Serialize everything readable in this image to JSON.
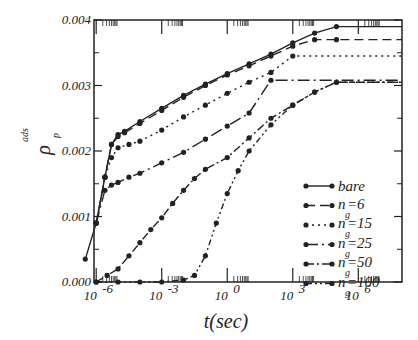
{
  "chart_data": {
    "type": "line",
    "title": "",
    "xlabel": "t(sec)",
    "ylabel": "ρ_p^ads",
    "ylabel_main": "ρ",
    "ylabel_sub": "p",
    "ylabel_sup": "ads",
    "xscale": "log",
    "xlim_log10": [
      -6,
      8
    ],
    "ylim": [
      0.0,
      0.004
    ],
    "x_tick_labels": [
      {
        "base": "10",
        "exp": "-6",
        "log": -6
      },
      {
        "base": "10",
        "exp": "-3",
        "log": -3
      },
      {
        "base": "10",
        "exp": "0",
        "log": 0
      },
      {
        "base": "10",
        "exp": "3",
        "log": 3
      },
      {
        "base": "10",
        "exp": "6",
        "log": 6
      }
    ],
    "y_tick_labels": [
      "0.000",
      "0.001",
      "0.002",
      "0.003",
      "0.004"
    ],
    "y_ticks": [
      0.0,
      0.001,
      0.002,
      0.003,
      0.004
    ],
    "grid": false,
    "legend_position": "lower right inside",
    "series": [
      {
        "name": "bare",
        "label": "bare",
        "sub": "",
        "dash": "",
        "log_t": [
          -6.5,
          -6.0,
          -5.6,
          -5.3,
          -5.0,
          -4.7,
          -4.0,
          -3.0,
          -2.0,
          -1.0,
          0.0,
          1.0,
          2.0,
          3.0,
          4.0,
          5.0,
          8.0
        ],
        "values": [
          0.00035,
          0.0009,
          0.0016,
          0.0021,
          0.00225,
          0.0023,
          0.00245,
          0.00265,
          0.00285,
          0.00302,
          0.00318,
          0.00333,
          0.00348,
          0.00365,
          0.0038,
          0.0039,
          0.0039
        ]
      },
      {
        "name": "n_g=6",
        "label": "n",
        "sub": "g",
        "value_text": "=6",
        "dash": "9,5",
        "log_t": [
          -6.0,
          -5.6,
          -5.3,
          -5.0,
          -4.7,
          -4.0,
          -3.0,
          -2.0,
          -1.0,
          0.0,
          1.0,
          2.0,
          3.0,
          4.0,
          5.0,
          8.0
        ],
        "values": [
          0.0009,
          0.0016,
          0.0021,
          0.00222,
          0.00228,
          0.00242,
          0.00262,
          0.00282,
          0.003,
          0.00316,
          0.0033,
          0.00345,
          0.0036,
          0.0037,
          0.0037,
          0.0037
        ]
      },
      {
        "name": "n_g=15",
        "label": "n",
        "sub": "g",
        "value_text": "=15",
        "dash": "2,4",
        "log_t": [
          -6.0,
          -5.6,
          -5.3,
          -5.0,
          -4.5,
          -4.0,
          -3.0,
          -2.0,
          -1.0,
          0.0,
          1.0,
          2.0,
          3.0,
          8.0
        ],
        "values": [
          0.0009,
          0.0016,
          0.0019,
          0.00205,
          0.0021,
          0.00215,
          0.00232,
          0.00252,
          0.0027,
          0.00288,
          0.00305,
          0.0032,
          0.00345,
          0.00345
        ]
      },
      {
        "name": "n_g=25",
        "label": "n",
        "sub": "g",
        "value_text": "=25",
        "dash": "12,4,2,4",
        "log_t": [
          -6.0,
          -5.6,
          -5.3,
          -5.0,
          -4.5,
          -4.0,
          -3.0,
          -2.0,
          -1.0,
          0.0,
          1.0,
          2.0,
          8.0
        ],
        "values": [
          0.0009,
          0.0014,
          0.00148,
          0.00152,
          0.0016,
          0.00166,
          0.00182,
          0.00198,
          0.00218,
          0.00238,
          0.00258,
          0.00308,
          0.00308
        ]
      },
      {
        "name": "n_g=50",
        "label": "n",
        "sub": "g",
        "value_text": "=50",
        "dash": "8,3,2,3",
        "log_t": [
          -6.0,
          -5.5,
          -5.0,
          -4.5,
          -4.0,
          -3.5,
          -3.0,
          -2.5,
          -2.0,
          -1.5,
          -1.0,
          0.0,
          1.0,
          2.0,
          3.0,
          4.0,
          5.0,
          8.0
        ],
        "values": [
          0.0,
          0.0001,
          0.0002,
          0.0004,
          0.0006,
          0.0008,
          0.00098,
          0.0012,
          0.0014,
          0.00158,
          0.00172,
          0.0019,
          0.0022,
          0.0025,
          0.0027,
          0.0029,
          0.00305,
          0.00305
        ]
      },
      {
        "name": "n_g=100",
        "label": "n",
        "sub": "g",
        "value_text": "=100",
        "dash": "6,3,2,3,2,3",
        "log_t": [
          -6.0,
          -5.0,
          -4.0,
          -3.0,
          -2.0,
          -1.5,
          -1.0,
          -0.5,
          0.0,
          0.5,
          1.0,
          2.0,
          3.0,
          4.0,
          5.0,
          8.0
        ],
        "values": [
          0.0,
          0.0,
          0.0,
          0.0,
          3e-05,
          0.0001,
          0.0004,
          0.0009,
          0.00135,
          0.0017,
          0.002,
          0.0024,
          0.0027,
          0.0029,
          0.00305,
          0.00305
        ]
      }
    ]
  }
}
